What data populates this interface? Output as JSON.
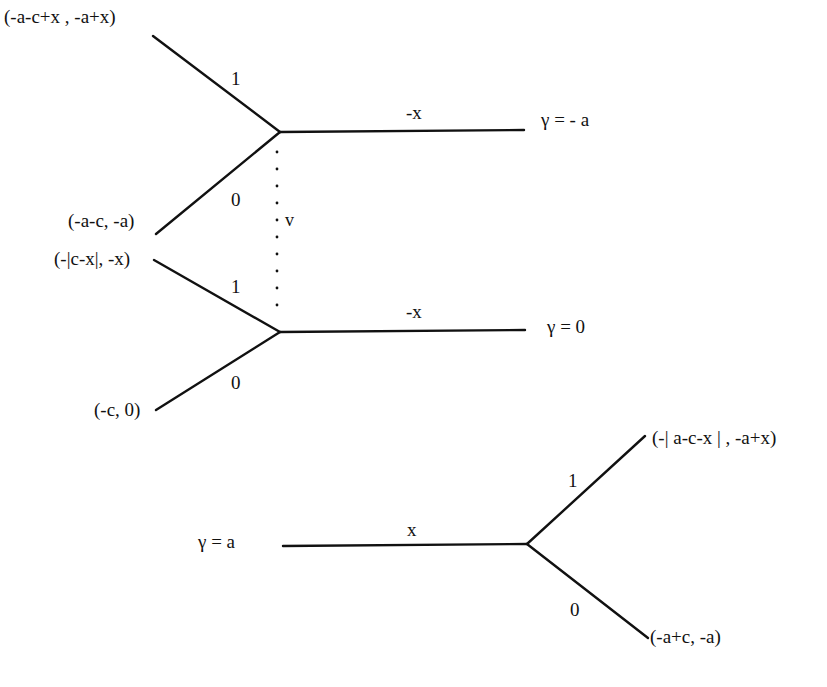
{
  "diagram": {
    "type": "game-tree",
    "upper_tree": {
      "info_set_label": "v",
      "top_node": {
        "payoff_branch_1": "(-a-c+x , -a+x)",
        "payoff_branch_0": "(-a-c, -a)",
        "branch_1_label": "1",
        "branch_0_label": "0",
        "stem_label": "-x",
        "gamma_label": "γ  = - a"
      },
      "bottom_node": {
        "payoff_branch_1": "(-|c-x|, -x)",
        "payoff_branch_0": "(-c, 0)",
        "branch_1_label": "1",
        "branch_0_label": "0",
        "stem_label": "-x",
        "gamma_label": "γ = 0"
      }
    },
    "lower_tree": {
      "gamma_label": "γ = a",
      "stem_label": "x",
      "branch_1_label": "1",
      "branch_0_label": "0",
      "payoff_branch_1": "(-| a-c-x | , -a+x)",
      "payoff_branch_0": "(-a+c, -a)"
    }
  }
}
